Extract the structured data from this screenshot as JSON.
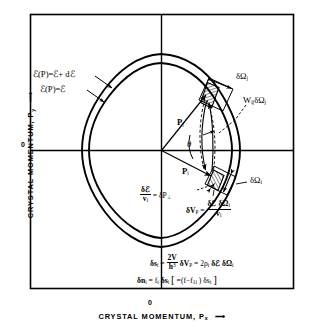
{
  "figure": {
    "title_semantic": "crystal-momentum-space-scattering-diagram",
    "background": "#ffffff",
    "ink": "#000000"
  },
  "axes": {
    "y_label": "CRYSTAL MOMENTUM, P",
    "y_label_sub": "y",
    "y_arrow": "⟶",
    "x_label": "CRYSTAL MOMENTUM, P",
    "x_label_sub": "x",
    "x_arrow": "⟶",
    "origin_y": "0",
    "origin_x": "0"
  },
  "contours": {
    "outer_label_main": "ℰ(P)=ℰ+ dℰ",
    "inner_label_main": "ℰ(P)=ℰ",
    "outer_name": "energy-contour-outer",
    "inner_name": "energy-contour-inner"
  },
  "vectors": {
    "p_j": "P",
    "p_j_sub": "j",
    "p_i": "P",
    "p_i_sub": "i",
    "theta": "θ"
  },
  "annotations": {
    "delta_omega_j": "δΩ",
    "delta_omega_j_sub": "j",
    "delta_omega_i": "δΩ",
    "delta_omega_i_sub": "i",
    "w_ij": "W",
    "w_ij_sub": "ij",
    "w_ij_tail": "δΩ",
    "w_ij_tail_sub": "j",
    "dperp_num": "δℰ",
    "dperp_den": "v",
    "dperp_den_sub": "i",
    "dperp_eq": "= δP",
    "dperp_sym": "⊥",
    "dvp_lhs": "δV",
    "dvp_lhs_sub": "P",
    "dvp_eq": "=",
    "dvp_num": "δℰ δΩ",
    "dvp_num_sub": "i",
    "dvp_den": "v",
    "dvp_den_sub": "i"
  },
  "equations": {
    "eq1": {
      "lhs": "δs",
      "lhs_sub": "i",
      "eq": "=",
      "num": "2V",
      "den": "h",
      "den_sup": "3",
      "mid": "δV",
      "mid_sub": "P",
      "eq2": "= 2ρ",
      "rho_sub": "i",
      "tail": "δℰ δΩ",
      "tail_sub": "i"
    },
    "eq2": {
      "lhs": "δn",
      "lhs_sub": "i",
      "eq": "= f",
      "f_sub": "i",
      "ds": "δs",
      "ds_sub": "i",
      "br_open": "[",
      "inner": "=(f−f",
      "inner_sub": "1i",
      "inner2": ") δs",
      "inner2_sub": "i",
      "br_close": "]"
    }
  }
}
